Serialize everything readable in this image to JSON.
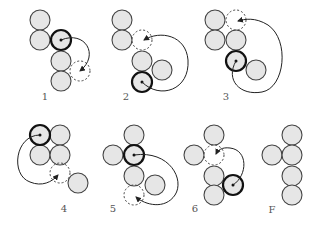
{
  "colors": {
    "coin_fill": "#e6e6e6",
    "coin_stroke": "#444444",
    "highlight_stroke": "#111111",
    "arrow": "#222222",
    "label": "#555555"
  },
  "radius": 10,
  "panels": [
    {
      "label": "1",
      "label_pos": [
        45,
        100
      ],
      "coins": [
        [
          40,
          20
        ],
        [
          40,
          40
        ],
        [
          61,
          61
        ],
        [
          61,
          81
        ]
      ],
      "moved_from": [
        61,
        40
      ],
      "moved_to": [
        80,
        71
      ],
      "arc": "M61,40 C85,30 100,55 80,71"
    },
    {
      "label": "2",
      "label_pos": [
        126,
        100
      ],
      "coins": [
        [
          122,
          20
        ],
        [
          122,
          40
        ],
        [
          142,
          61
        ],
        [
          162,
          70
        ]
      ],
      "moved_from": [
        142,
        82
      ],
      "moved_to": [
        142,
        40
      ],
      "arc": "M142,82 C160,100 190,90 188,60 C186,35 160,30 144,40"
    },
    {
      "label": "3",
      "label_pos": [
        226,
        100
      ],
      "coins": [
        [
          215,
          20
        ],
        [
          215,
          40
        ],
        [
          236,
          40
        ],
        [
          256,
          70
        ]
      ],
      "moved_from": [
        236,
        61
      ],
      "moved_to": [
        236,
        20
      ],
      "arc": "M236,61 C225,80 240,96 262,92 C285,88 290,40 268,25 C255,17 245,19 238,21"
    },
    {
      "label": "4",
      "label_pos": [
        64,
        212
      ],
      "coins": [
        [
          60,
          135
        ],
        [
          40,
          155
        ],
        [
          60,
          155
        ],
        [
          78,
          183
        ]
      ],
      "moved_from": [
        40,
        135
      ],
      "moved_to": [
        60,
        173
      ],
      "arc": "M40,135 C15,135 10,175 30,182 C42,187 52,182 58,175"
    },
    {
      "label": "5",
      "label_pos": [
        113,
        212
      ],
      "coins": [
        [
          134,
          135
        ],
        [
          113,
          155
        ],
        [
          134,
          176
        ],
        [
          155,
          185
        ]
      ],
      "moved_from": [
        134,
        155
      ],
      "moved_to": [
        134,
        195
      ],
      "arc": "M134,155 C170,150 185,180 175,195 C165,210 145,205 136,197"
    },
    {
      "label": "6",
      "label_pos": [
        195,
        212
      ],
      "coins": [
        [
          214,
          135
        ],
        [
          194,
          155
        ],
        [
          214,
          176
        ],
        [
          214,
          195
        ]
      ],
      "moved_from": [
        233,
        185
      ],
      "moved_to": [
        214,
        155
      ],
      "arc": "M233,185 C248,175 248,150 230,148 C222,147 218,150 216,154"
    },
    {
      "label": "F",
      "label_pos": [
        272,
        213
      ],
      "coins": [
        [
          292,
          135
        ],
        [
          272,
          155
        ],
        [
          292,
          155
        ],
        [
          292,
          176
        ],
        [
          292,
          195
        ]
      ],
      "moved_from": null,
      "moved_to": null,
      "arc": null
    }
  ]
}
